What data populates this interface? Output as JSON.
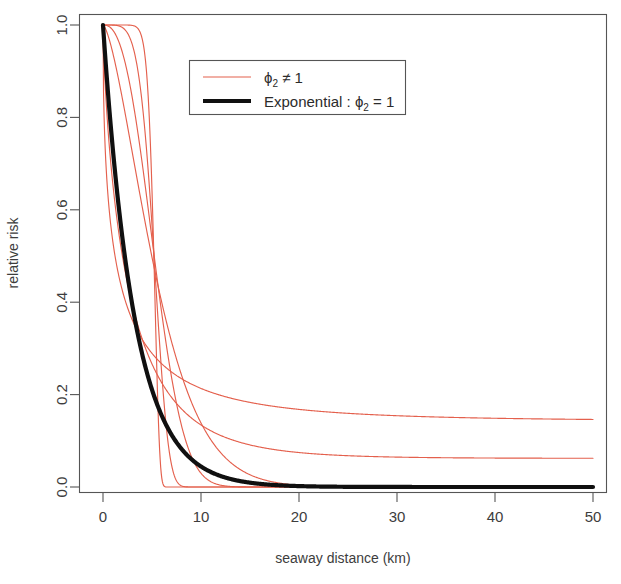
{
  "chart_data": {
    "type": "line",
    "title": "",
    "xlabel": "seaway distance (km)",
    "ylabel": "relative risk",
    "xlim": [
      0,
      50
    ],
    "ylim": [
      0.0,
      1.0
    ],
    "xticks": [
      0,
      10,
      20,
      30,
      40,
      50
    ],
    "xtick_labels": [
      "0",
      "10",
      "20",
      "30",
      "40",
      "50"
    ],
    "yticks": [
      0.0,
      0.2,
      0.4,
      0.6,
      0.8,
      1.0
    ],
    "ytick_labels": [
      "0.0",
      "0.2",
      "0.4",
      "0.6",
      "0.8",
      "1.0"
    ],
    "grid": false,
    "legend_position": "top-center-left",
    "crossover_point": {
      "x": 5.0,
      "y": 0.21
    },
    "accent_color": "#e4604d",
    "reference_color": "#101010",
    "model": "relative risk = exp(-(x/phi1)^phi2), family sharing a common crossing point at x = 5 km",
    "series": [
      {
        "name": "phi2 = 0.5",
        "group": "phi2 != 1",
        "color": "#e4604d",
        "linewidth": 1.15,
        "phi2": 0.5,
        "phi1": 1.6,
        "tail_value_at_50": 0.143,
        "x": [
          0,
          0.5,
          1,
          2,
          3,
          4,
          5,
          6,
          8,
          10,
          12.5,
          15,
          20,
          25,
          30,
          35,
          40,
          45,
          50
        ],
        "y": [
          1.0,
          0.574,
          0.456,
          0.326,
          0.251,
          0.201,
          0.172,
          0.147,
          0.114,
          0.092,
          0.073,
          0.06,
          0.043,
          0.032,
          0.025,
          0.02,
          0.016,
          0.014,
          0.012
        ]
      },
      {
        "name": "phi2 = 0.75",
        "group": "phi2 != 1",
        "color": "#e4604d",
        "linewidth": 1.15,
        "phi2": 0.75,
        "phi1": 2.85,
        "tail_value_at_50": 0.062,
        "x": [
          0,
          0.5,
          1,
          2,
          3,
          4,
          5,
          6,
          8,
          10,
          12.5,
          15,
          20,
          25,
          30,
          35,
          40,
          45,
          50
        ],
        "y": [
          1.0,
          0.76,
          0.646,
          0.5,
          0.401,
          0.33,
          0.276,
          0.234,
          0.173,
          0.131,
          0.096,
          0.072,
          0.042,
          0.025,
          0.016,
          0.01,
          0.007,
          0.005,
          0.003
        ]
      },
      {
        "name": "phi2 = 1.5",
        "group": "phi2 != 1",
        "color": "#e4604d",
        "linewidth": 1.15,
        "phi2": 1.5,
        "phi1": 6.35,
        "tail_value_at_50": 0.0,
        "x": [
          0,
          0.5,
          1,
          2,
          3,
          4,
          5,
          6,
          8,
          10,
          12.5,
          15,
          20,
          25,
          30,
          35,
          40,
          45,
          50
        ],
        "y": [
          1.0,
          0.978,
          0.94,
          0.84,
          0.727,
          0.613,
          0.507,
          0.41,
          0.256,
          0.15,
          0.072,
          0.032,
          0.005,
          0.001,
          0.0,
          0.0,
          0.0,
          0.0,
          0.0
        ]
      },
      {
        "name": "phi2 = 2.5",
        "group": "phi2 != 1",
        "color": "#e4604d",
        "linewidth": 1.15,
        "phi2": 2.5,
        "phi1": 6.05,
        "tail_value_at_50": 0.0,
        "x": [
          0,
          0.5,
          1,
          2,
          3,
          4,
          5,
          6,
          8,
          10,
          12.5,
          15,
          20,
          25,
          30,
          35,
          40,
          45,
          50
        ],
        "y": [
          1.0,
          0.998,
          0.99,
          0.943,
          0.853,
          0.705,
          0.513,
          0.313,
          0.06,
          0.005,
          0.0,
          0.0,
          0.0,
          0.0,
          0.0,
          0.0,
          0.0,
          0.0,
          0.0
        ]
      },
      {
        "name": "phi2 = 5",
        "group": "phi2 != 1",
        "color": "#e4604d",
        "linewidth": 1.15,
        "phi2": 5.0,
        "phi1": 5.6,
        "tail_value_at_50": 0.0,
        "x": [
          0,
          0.5,
          1,
          2,
          3,
          4,
          5,
          6,
          8,
          10,
          12.5,
          15,
          20,
          25,
          30,
          35,
          40,
          45,
          50
        ],
        "y": [
          1.0,
          1.0,
          1.0,
          0.993,
          0.956,
          0.828,
          0.549,
          0.203,
          0.003,
          0.0,
          0.0,
          0.0,
          0.0,
          0.0,
          0.0,
          0.0,
          0.0,
          0.0,
          0.0
        ]
      },
      {
        "name": "phi2 = 12",
        "group": "phi2 != 1",
        "color": "#e4604d",
        "linewidth": 1.15,
        "phi2": 12.0,
        "phi1": 5.35,
        "tail_value_at_50": 0.0,
        "x": [
          0,
          0.5,
          1,
          2,
          3,
          4,
          5,
          6,
          8,
          10,
          12.5,
          15,
          20,
          25,
          30,
          35,
          40,
          45,
          50
        ],
        "y": [
          1.0,
          1.0,
          1.0,
          1.0,
          1.0,
          0.992,
          0.64,
          0.02,
          0.0,
          0.0,
          0.0,
          0.0,
          0.0,
          0.0,
          0.0,
          0.0,
          0.0,
          0.0,
          0.0
        ]
      },
      {
        "name": "Exponential : phi2 = 1",
        "group": "exponential",
        "color": "#101010",
        "linewidth": 4.2,
        "phi2": 1.0,
        "phi1": 3.21,
        "tail_value_at_50": 0.0,
        "x": [
          0,
          0.5,
          1,
          2,
          3,
          4,
          5,
          6,
          8,
          10,
          12.5,
          15,
          20,
          25,
          30,
          35,
          40,
          45,
          50
        ],
        "y": [
          1.0,
          0.856,
          0.732,
          0.536,
          0.393,
          0.287,
          0.21,
          0.154,
          0.083,
          0.044,
          0.02,
          0.009,
          0.002,
          0.0,
          0.0,
          0.0,
          0.0,
          0.0,
          0.0
        ]
      }
    ],
    "legend": {
      "entries": [
        {
          "key_style": "thin-red-line",
          "symbol": "ϕ",
          "subscript": "2",
          "relation": "≠ 1",
          "label": "ϕ₂ ≠ 1"
        },
        {
          "key_style": "thick-black-line",
          "prefix": "Exponential : ",
          "symbol": "ϕ",
          "subscript": "2",
          "relation": "= 1",
          "label": "Exponential : ϕ₂ = 1"
        }
      ]
    }
  },
  "axes": {
    "x_title": "seaway distance (km)",
    "y_title": "relative risk"
  }
}
